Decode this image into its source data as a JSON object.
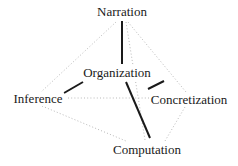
{
  "diagram": {
    "title": "",
    "type": "node-link-pentagon",
    "colors": {
      "background": "#ffffff",
      "text": "#1a1a1a",
      "solid_edge": "#1a1a1a",
      "dotted_edge": "#b9b9b9"
    },
    "nodes": [
      {
        "id": "narration",
        "label": "Narration",
        "x": 122,
        "y": 12
      },
      {
        "id": "organization",
        "label": "Organization",
        "x": 117,
        "y": 73
      },
      {
        "id": "inference",
        "label": "Inference",
        "x": 38,
        "y": 99
      },
      {
        "id": "concretization",
        "label": "Concretization",
        "x": 189,
        "y": 100
      },
      {
        "id": "computation",
        "label": "Computation",
        "x": 147,
        "y": 150
      }
    ],
    "edges": [
      {
        "id": "narration-organization",
        "from": "narration",
        "to": "organization",
        "style": "solid",
        "x1": 122,
        "y1": 21,
        "x2": 122,
        "y2": 64
      },
      {
        "id": "organization-inference",
        "from": "organization",
        "to": "inference",
        "style": "solid",
        "x1": 83,
        "y1": 82,
        "x2": 64,
        "y2": 93
      },
      {
        "id": "organization-concretization",
        "from": "organization",
        "to": "concretization",
        "style": "solid",
        "x1": 148,
        "y1": 89,
        "x2": 164,
        "y2": 81
      },
      {
        "id": "organization-computation",
        "from": "organization",
        "to": "computation",
        "style": "solid",
        "x1": 126,
        "y1": 82,
        "x2": 150,
        "y2": 138
      },
      {
        "id": "narration-inference",
        "from": "narration",
        "to": "inference",
        "style": "dotted",
        "x1": 116,
        "y1": 22,
        "x2": 41,
        "y2": 92
      },
      {
        "id": "narration-concretization",
        "from": "narration",
        "to": "concretization",
        "style": "dotted",
        "x1": 128,
        "y1": 22,
        "x2": 186,
        "y2": 92
      },
      {
        "id": "narration-computation",
        "from": "narration",
        "to": "computation",
        "style": "dotted",
        "x1": 126,
        "y1": 22,
        "x2": 145,
        "y2": 140
      },
      {
        "id": "inference-concretization",
        "from": "inference",
        "to": "concretization",
        "style": "dotted",
        "x1": 68,
        "y1": 98,
        "x2": 157,
        "y2": 98
      },
      {
        "id": "inference-computation",
        "from": "inference",
        "to": "computation",
        "style": "dotted",
        "x1": 42,
        "y1": 106,
        "x2": 126,
        "y2": 141
      },
      {
        "id": "concretization-computation",
        "from": "concretization",
        "to": "computation",
        "style": "dotted",
        "x1": 185,
        "y1": 107,
        "x2": 165,
        "y2": 141
      }
    ]
  }
}
